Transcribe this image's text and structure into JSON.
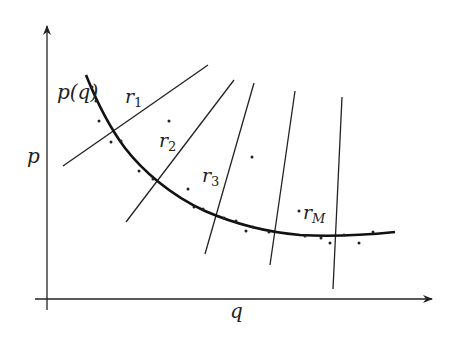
{
  "figure": {
    "axes": {
      "x_label": "q",
      "y_label": "p"
    },
    "curve_label": "p(q)",
    "rays": [
      {
        "name": "r1",
        "base": "r",
        "sub": "1"
      },
      {
        "name": "r2",
        "base": "r",
        "sub": "2"
      },
      {
        "name": "r3",
        "base": "r",
        "sub": "3"
      },
      {
        "name": "r4",
        "base": "",
        "sub": ""
      },
      {
        "name": "rM",
        "base": "r",
        "sub": "M"
      }
    ],
    "colors": {
      "ink": "#222222",
      "background": "#ffffff"
    }
  }
}
